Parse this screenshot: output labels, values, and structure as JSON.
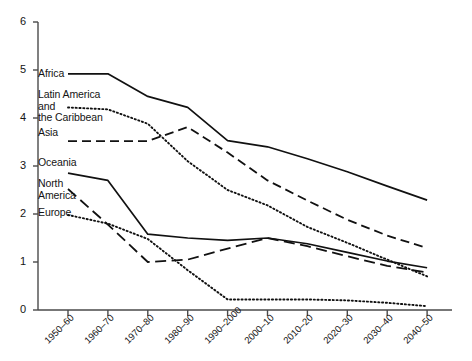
{
  "chart_data": {
    "type": "line",
    "title": "",
    "subtitle": "",
    "xlabel": "",
    "ylabel": "",
    "xlim": [
      0,
      9
    ],
    "ylim": [
      0,
      6
    ],
    "grid": false,
    "legend": "inline-left-of-lines",
    "categories": [
      "1950–60",
      "1960–70",
      "1970–80",
      "1980–90",
      "1990–2000",
      "2000–10",
      "2010–20",
      "2020–30",
      "2030–40",
      "2040–50"
    ],
    "yticks": [
      "0",
      "1",
      "2",
      "3",
      "4",
      "5",
      "6"
    ],
    "ytick_values": [
      0,
      1,
      2,
      3,
      4,
      5,
      6
    ],
    "series": [
      {
        "name": "Africa",
        "style": "solid",
        "color": "#111111",
        "values": [
          4.92,
          4.92,
          4.45,
          4.22,
          3.53,
          3.4,
          3.15,
          2.88,
          2.58,
          2.29
        ]
      },
      {
        "name": "Latin America and the Caribbean",
        "label_lines": [
          "Latin America",
          "and",
          "the Caribbean"
        ],
        "style": "dotted",
        "color": "#111111",
        "values": [
          4.22,
          4.18,
          3.88,
          3.1,
          2.5,
          2.18,
          1.73,
          1.4,
          1.05,
          0.7
        ]
      },
      {
        "name": "Asia",
        "style": "dashed",
        "color": "#111111",
        "values": [
          3.52,
          3.52,
          3.52,
          3.81,
          3.28,
          2.7,
          2.28,
          1.88,
          1.55,
          1.29
        ]
      },
      {
        "name": "Oceania",
        "style": "solid",
        "color": "#111111",
        "values": [
          2.85,
          2.7,
          1.58,
          1.5,
          1.45,
          1.5,
          1.38,
          1.2,
          1.02,
          0.88
        ]
      },
      {
        "name": "North America",
        "label_lines": [
          "North",
          "America"
        ],
        "style": "long-dash",
        "color": "#111111",
        "values": [
          2.52,
          1.78,
          1.0,
          1.05,
          1.28,
          1.5,
          1.33,
          1.12,
          0.92,
          0.78
        ]
      },
      {
        "name": "Europe",
        "style": "dotted",
        "color": "#111111",
        "values": [
          1.98,
          1.8,
          1.48,
          0.83,
          0.22,
          0.22,
          0.22,
          0.2,
          0.15,
          0.08
        ]
      }
    ],
    "series_labels": [
      {
        "name": "Africa",
        "lines": [
          "Africa"
        ],
        "x": 38,
        "y": 68
      },
      {
        "name": "Latin America and the Caribbean",
        "lines": [
          "Latin America",
          "and",
          "the Caribbean"
        ],
        "x": 38,
        "y": 89
      },
      {
        "name": "Asia",
        "lines": [
          "Asia"
        ],
        "x": 38,
        "y": 127
      },
      {
        "name": "Oceania",
        "lines": [
          "Oceania"
        ],
        "x": 38,
        "y": 157
      },
      {
        "name": "North America",
        "lines": [
          "North",
          "America"
        ],
        "x": 38,
        "y": 178
      },
      {
        "name": "Europe",
        "lines": [
          "Europe"
        ],
        "x": 38,
        "y": 207
      }
    ]
  }
}
